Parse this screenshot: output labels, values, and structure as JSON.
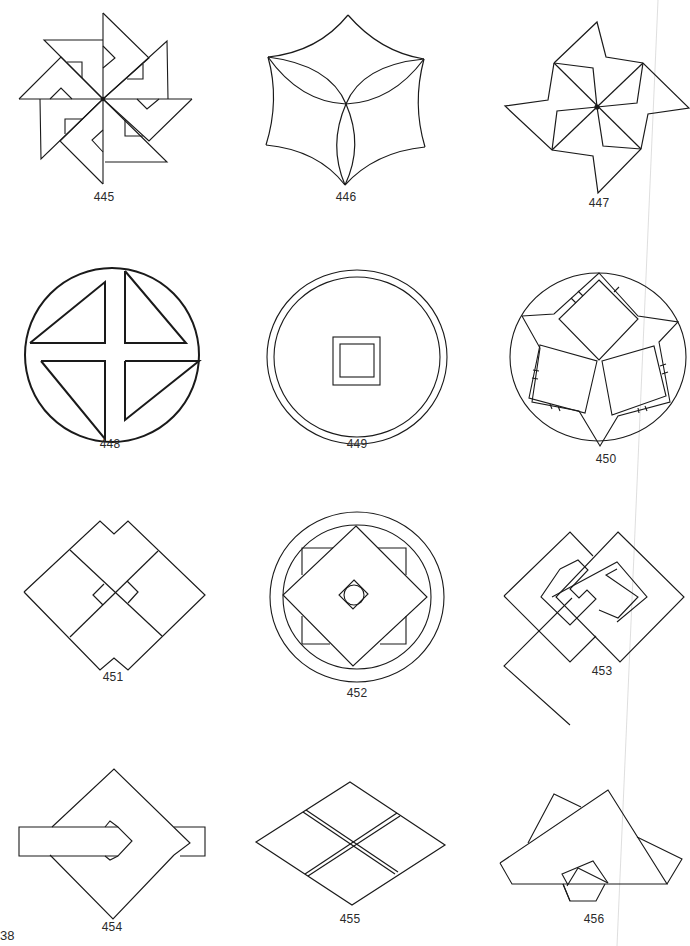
{
  "page": {
    "page_number": "38",
    "background": "#ffffff",
    "ink_color": "#1a1a1a"
  },
  "figures": [
    {
      "number": "445",
      "description": "Eight-bladed pinwheel of overlapping right triangles with notched corners"
    },
    {
      "number": "446",
      "description": "Curved hexagonal star with three intersecting lens arcs meeting at center"
    },
    {
      "number": "447",
      "description": "Four-armed pinwheel of triangles radiating from a central point"
    },
    {
      "number": "448",
      "description": "Circle divided by a thick cross into four triangles"
    },
    {
      "number": "449",
      "description": "Double circle with a double square at center (coin motif)"
    },
    {
      "number": "450",
      "description": "Circle enclosing three squares arranged around a central point with star outline"
    },
    {
      "number": "451",
      "description": "Diamond composed of four squares with notched top and bottom"
    },
    {
      "number": "452",
      "description": "Double circle with rotated square over square and small center diamond"
    },
    {
      "number": "453",
      "description": "Two interlocking diamond frames"
    },
    {
      "number": "454",
      "description": "Diamond pierced by a horizontal arrow band"
    },
    {
      "number": "455",
      "description": "Rhombus divided into four smaller rhombi with double dividing lines"
    },
    {
      "number": "456",
      "description": "Overlapping triangles forming a mountain-like shape with a hexagon below"
    }
  ]
}
